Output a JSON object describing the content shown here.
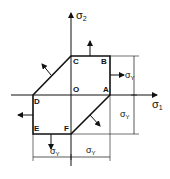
{
  "diagram": {
    "axes": {
      "x_label": "σ",
      "x_sub": "1",
      "y_label": "σ",
      "y_sub": "2"
    },
    "points": {
      "A": "A",
      "B": "B",
      "C": "C",
      "D": "D",
      "E": "E",
      "F": "F",
      "O": "O"
    },
    "dimensions": {
      "right_top": {
        "label": "σ",
        "sub": "Y"
      },
      "right_bottom": {
        "label": "σ",
        "sub": "Y"
      },
      "bottom_left": {
        "label": "σ",
        "sub": "Y"
      },
      "bottom_right": {
        "label": "σ",
        "sub": "Y"
      }
    },
    "colors": {
      "line": "#111111",
      "background": "#ffffff"
    }
  }
}
